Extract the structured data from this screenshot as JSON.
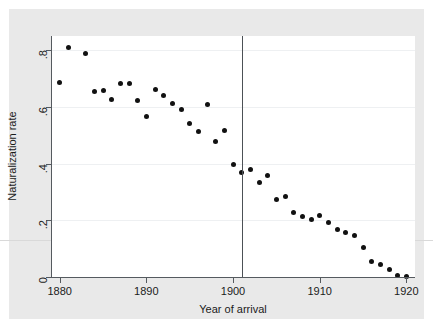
{
  "figure": {
    "background_color": "#ffffff",
    "panel_color": "#e9e9e9",
    "plot_color": "#ffffff",
    "marker_color": "#111111",
    "axis_color": "#555a5f",
    "grid_color": "#eef0f2",
    "vline_color": "#4c5156"
  },
  "chart_data": {
    "type": "scatter",
    "title": "",
    "xlabel": "Year of arrival",
    "ylabel": "Naturalization rate",
    "xlim": [
      1879,
      1921
    ],
    "ylim": [
      0,
      0.85
    ],
    "xticks": [
      1880,
      1890,
      1900,
      1910,
      1920
    ],
    "xticklabels": [
      "1880",
      "1890",
      "1900",
      "1910",
      "1920"
    ],
    "yticks": [
      0,
      0.2,
      0.4,
      0.6,
      0.8
    ],
    "yticklabels": [
      "0",
      ".2",
      ".4",
      ".6",
      ".8"
    ],
    "grid": "horizontal",
    "legend": "none",
    "annotations": [
      {
        "type": "vertical-line",
        "name": "cutoff-1901",
        "x": 1901,
        "label": ""
      }
    ],
    "x": [
      1880,
      1881,
      1883,
      1884,
      1885,
      1886,
      1887,
      1888,
      1889,
      1890,
      1891,
      1892,
      1893,
      1894,
      1895,
      1896,
      1897,
      1898,
      1899,
      1900,
      1901,
      1902,
      1903,
      1904,
      1905,
      1906,
      1907,
      1908,
      1909,
      1910,
      1911,
      1912,
      1913,
      1914,
      1915,
      1916,
      1917,
      1918,
      1919,
      1920
    ],
    "y": [
      0.685,
      0.81,
      0.79,
      0.655,
      0.657,
      0.625,
      0.683,
      0.683,
      0.622,
      0.565,
      0.662,
      0.641,
      0.613,
      0.59,
      0.54,
      0.512,
      0.61,
      0.478,
      0.518,
      0.397,
      0.367,
      0.379,
      0.333,
      0.359,
      0.272,
      0.285,
      0.227,
      0.215,
      0.203,
      0.216,
      0.193,
      0.166,
      0.158,
      0.148,
      0.104,
      0.056,
      0.044,
      0.027,
      0.004,
      0.003
    ],
    "series_name": "Naturalization rate by year of arrival",
    "n_points": 40
  }
}
